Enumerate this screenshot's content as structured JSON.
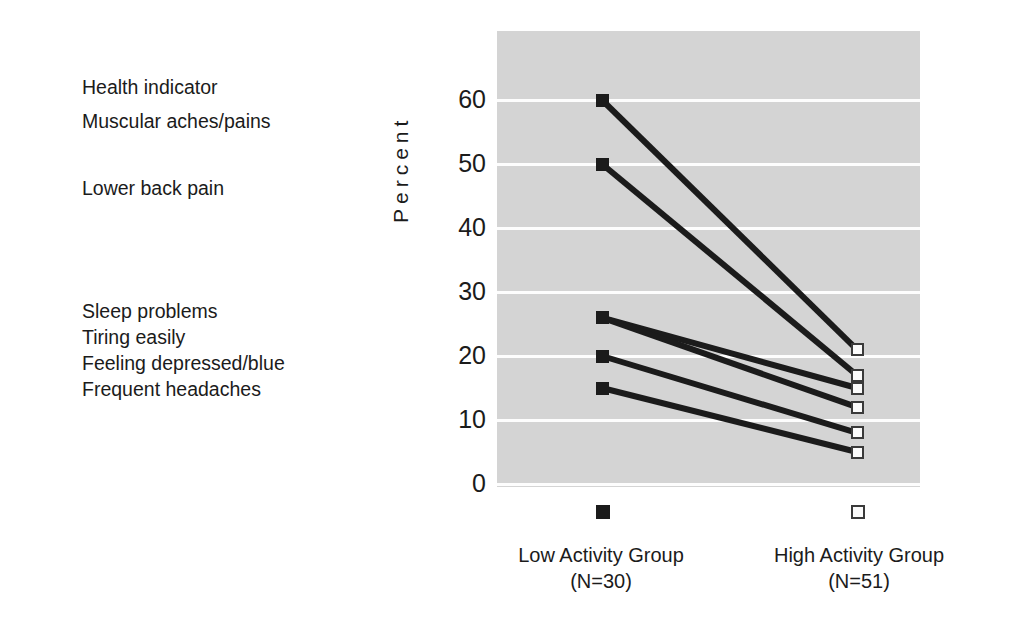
{
  "figure": {
    "indicator_heading": "Health indicator",
    "y_axis_label": "Percent",
    "plot_background": "#d4d4d4",
    "gridline_color": "#fdfdfd",
    "line_color": "#1b1b1b"
  },
  "indicator_labels": [
    {
      "text": "Health indicator",
      "top": 76
    },
    {
      "text": "Muscular aches/pains",
      "top": 110
    },
    {
      "text": "Lower back pain",
      "top": 177
    },
    {
      "text": "Sleep problems",
      "top": 300
    },
    {
      "text": "Tiring easily",
      "top": 326
    },
    {
      "text": "Feeling depressed/blue",
      "top": 352
    },
    {
      "text": "Frequent headaches",
      "top": 378
    }
  ],
  "y_ticks": [
    {
      "label": "60",
      "value": 60
    },
    {
      "label": "50",
      "value": 50
    },
    {
      "label": "40",
      "value": 40
    },
    {
      "label": "30",
      "value": 30
    },
    {
      "label": "20",
      "value": 20
    },
    {
      "label": "10",
      "value": 10
    },
    {
      "label": "0",
      "value": 0
    }
  ],
  "groups": [
    {
      "name": "Low Activity Group",
      "n_label": "(N=30)",
      "marker": "filled-square"
    },
    {
      "name": "High Activity Group",
      "n_label": "(N=51)",
      "marker": "open-square"
    }
  ],
  "chart_data": {
    "type": "line",
    "title": "",
    "subtitle": "",
    "xlabel": "",
    "ylabel": "Percent",
    "categories": [
      "Low Activity Group",
      "High Activity Group"
    ],
    "category_sublabels": [
      "(N=30)",
      "(N=51)"
    ],
    "ylim": [
      0,
      60
    ],
    "ytick_step": 10,
    "grid": true,
    "legend": "below-axis",
    "x": [
      0,
      1
    ],
    "series": [
      {
        "name": "Muscular aches/pains",
        "values": [
          60,
          21
        ]
      },
      {
        "name": "Lower back pain",
        "values": [
          50,
          17
        ]
      },
      {
        "name": "Sleep problems",
        "values": [
          26,
          15
        ]
      },
      {
        "name": "Tiring easily",
        "values": [
          26,
          12
        ]
      },
      {
        "name": "Feeling depressed/blue",
        "values": [
          20,
          8
        ]
      },
      {
        "name": "Frequent headaches",
        "values": [
          15,
          5
        ]
      }
    ],
    "marker_styles": {
      "Low Activity Group": "filled-square",
      "High Activity Group": "open-square"
    },
    "annotations": [
      "Health indicator"
    ]
  }
}
